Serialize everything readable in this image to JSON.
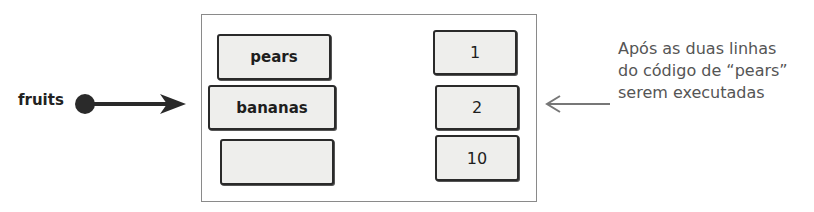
{
  "diagram": {
    "variable": {
      "name": "fruits"
    },
    "keys": [
      {
        "label": "pears"
      },
      {
        "label": "bananas"
      },
      {
        "label": ""
      }
    ],
    "values": [
      {
        "label": "1"
      },
      {
        "label": "2"
      },
      {
        "label": "10"
      }
    ],
    "annotation": {
      "lines": [
        "Após as duas linhas",
        "do código de “pears”",
        "serem executadas"
      ]
    },
    "colors": {
      "ink": "#2a2a2a",
      "box_fill": "#eeeeec",
      "frame": "#8a8a8a",
      "note": "#555555"
    }
  }
}
